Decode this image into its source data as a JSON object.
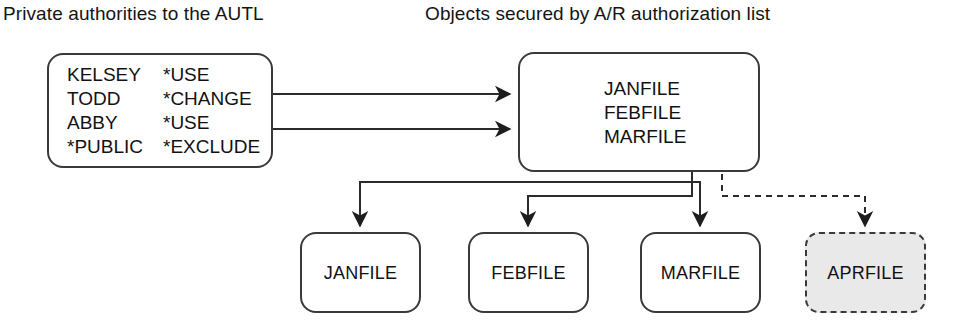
{
  "diagram": {
    "title_left": "Private authorities to the AUTL",
    "title_right": "Objects secured by A/R authorization list",
    "colors": {
      "background": "#ffffff",
      "stroke": "#3a3a3a",
      "text": "#121212",
      "dashed_node_fill": "#e9e9e9"
    },
    "authority_list": {
      "name": "autl-box",
      "entries": [
        {
          "user": "KELSEY",
          "authority": "*USE"
        },
        {
          "user": "TODD",
          "authority": "*CHANGE"
        },
        {
          "user": "ABBY",
          "authority": "*USE"
        },
        {
          "user": "*PUBLIC",
          "authority": "*EXCLUDE"
        }
      ]
    },
    "secured_objects": {
      "name": "secured-objects-box",
      "items": [
        "JANFILE",
        "FEBFILE",
        "MARFILE"
      ]
    },
    "objects": [
      {
        "label": "JANFILE",
        "style": "solid",
        "secured": true
      },
      {
        "label": "FEBFILE",
        "style": "solid",
        "secured": true
      },
      {
        "label": "MARFILE",
        "style": "solid",
        "secured": true
      },
      {
        "label": "APRFILE",
        "style": "dashed",
        "secured": false
      }
    ],
    "connectors": [
      {
        "from": "autl-box",
        "to": "secured-objects-box",
        "style": "solid",
        "arrow": true
      },
      {
        "from": "autl-box",
        "to": "secured-objects-box",
        "style": "solid",
        "arrow": true
      },
      {
        "from": "secured-objects-box",
        "to": "JANFILE",
        "style": "solid",
        "arrow": true
      },
      {
        "from": "secured-objects-box",
        "to": "FEBFILE",
        "style": "solid",
        "arrow": true
      },
      {
        "from": "secured-objects-box",
        "to": "MARFILE",
        "style": "solid",
        "arrow": true
      },
      {
        "from": "secured-objects-box",
        "to": "APRFILE",
        "style": "dashed",
        "arrow": true
      }
    ]
  }
}
